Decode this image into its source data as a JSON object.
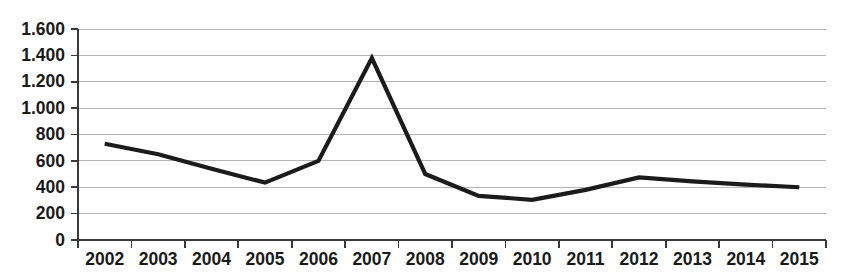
{
  "chart_data": {
    "type": "line",
    "title": "",
    "subtitle": "",
    "xlabel": "",
    "ylabel": "",
    "categories": [
      "2002",
      "2003",
      "2004",
      "2005",
      "2006",
      "2007",
      "2008",
      "2009",
      "2010",
      "2011",
      "2012",
      "2013",
      "2014",
      "2015"
    ],
    "values": [
      730,
      650,
      540,
      435,
      600,
      1380,
      500,
      335,
      305,
      380,
      475,
      445,
      420,
      400
    ],
    "series": [
      {
        "name": "",
        "values": [
          730,
          650,
          540,
          435,
          600,
          1380,
          500,
          335,
          305,
          380,
          475,
          445,
          420,
          400
        ]
      }
    ],
    "ylim": [
      0,
      1600
    ],
    "ytick_step": 200,
    "ytick_labels": [
      "0",
      "200",
      "400",
      "600",
      "800",
      "1.000",
      "1.200",
      "1.400",
      "1.600"
    ],
    "ytick_values": [
      0,
      200,
      400,
      600,
      800,
      1000,
      1200,
      1400,
      1600
    ],
    "grid": true,
    "legend": false,
    "legend_position": "none",
    "line_color": "#1b1b1b",
    "grid_color": "#b4b4b4",
    "axis_color": "#3a3a3a",
    "background_color": "#ffffff"
  }
}
